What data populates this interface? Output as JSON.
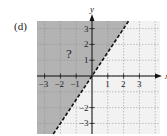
{
  "panel_label": "(d)",
  "chart_data": {
    "type": "line",
    "title": "",
    "xlabel": "x",
    "ylabel": "y",
    "xlim": [
      -3.5,
      4.2
    ],
    "ylim": [
      -3.6,
      3.5
    ],
    "grid": true,
    "x_ticks": [
      -3,
      -2,
      -1,
      1,
      2,
      3
    ],
    "y_ticks": [
      3,
      2,
      1,
      -2,
      -3
    ],
    "x_tick_labels": [
      "−3",
      "−2",
      "−1",
      "1",
      "2",
      "3"
    ],
    "y_tick_labels": [
      "3",
      "2",
      "1",
      "−2",
      "−3"
    ],
    "series": [
      {
        "name": "boundary",
        "style": "dashed",
        "equation": "y = 1.5x",
        "points": [
          [
            -2.1,
            -3.2
          ],
          [
            0,
            0
          ],
          [
            2.35,
            3.5
          ]
        ]
      }
    ],
    "shaded_region": "y > 1.5x (upper-left of the dashed line)",
    "annotation": "?",
    "colors": {
      "shade": "#b3b3b3",
      "unshaded": "#f2f2f2",
      "grid": "#888888",
      "line": "#111111"
    }
  }
}
